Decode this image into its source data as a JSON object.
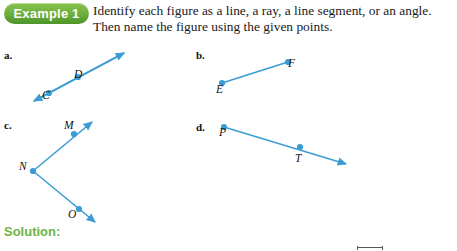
{
  "badge": {
    "label": "Example 1",
    "bg_color_top": "#86c04b",
    "bg_color_bottom": "#4e9529",
    "text_color": "#ffffff"
  },
  "prompt": {
    "line1": "Identify each figure as a line, a ray, a line segment, or an angle.",
    "line2": "Then name the figure using the given points."
  },
  "solution": {
    "heading": "Solution:",
    "color": "#6fb441"
  },
  "figure_color": "#3b9dd4",
  "parts": [
    {
      "letter": "a.",
      "figure_type": "line",
      "points": [
        {
          "label": "C",
          "x": 49,
          "y": 82
        },
        {
          "label": "D",
          "x": 78,
          "y": 64
        }
      ],
      "endpoints": [
        {
          "x": 34,
          "y": 101,
          "arrow": true
        },
        {
          "x": 124,
          "y": 53,
          "arrow": true
        }
      ]
    },
    {
      "letter": "b.",
      "figure_type": "line segment",
      "points": [
        {
          "label": "E",
          "x": 222,
          "y": 83
        },
        {
          "label": "F",
          "x": 288,
          "y": 62
        }
      ],
      "endpoints": [
        {
          "x": 222,
          "y": 83,
          "arrow": false
        },
        {
          "x": 288,
          "y": 62,
          "arrow": false
        }
      ]
    },
    {
      "letter": "c.",
      "figure_type": "angle",
      "points": [
        {
          "label": "M",
          "x": 74,
          "y": 134
        },
        {
          "label": "N",
          "x": 33,
          "y": 171
        },
        {
          "label": "O",
          "x": 79,
          "y": 209
        }
      ],
      "endpoints": [
        {
          "x": 92,
          "y": 122,
          "arrow": true
        },
        {
          "x": 95,
          "y": 222,
          "arrow": true
        }
      ]
    },
    {
      "letter": "d.",
      "figure_type": "ray",
      "points": [
        {
          "label": "P",
          "x": 224,
          "y": 127
        },
        {
          "label": "T",
          "x": 300,
          "y": 147
        }
      ],
      "endpoints": [
        {
          "x": 224,
          "y": 127,
          "arrow": false
        },
        {
          "x": 346,
          "y": 164,
          "arrow": true
        }
      ]
    }
  ],
  "cutoff_notation": {
    "present": true
  }
}
